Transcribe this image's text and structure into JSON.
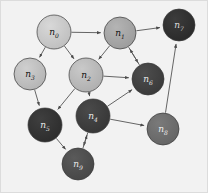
{
  "figure": {
    "background_color": "#f2f2f2",
    "border_color": "#d8d8d8",
    "width": 208,
    "height": 193
  },
  "graph": {
    "type": "directed-graph",
    "node_count": 10,
    "edge_count": 16,
    "edge_color": "#555555",
    "node_stroke_color": "#3a3a3a",
    "label_light_color": "#111111",
    "label_dark_color": "#e8e8e8",
    "nodes": [
      {
        "id": "n0",
        "label": "n",
        "sub": "0",
        "x": 54,
        "y": 32,
        "r": 17,
        "fill": "#d8d8d8",
        "fill_edge": "#bdbdbd",
        "label_color": "#111111"
      },
      {
        "id": "n1",
        "label": "n",
        "sub": "1",
        "x": 120,
        "y": 33,
        "r": 16,
        "fill": "#b4b4b4",
        "fill_edge": "#9a9a9a",
        "label_color": "#111111"
      },
      {
        "id": "n2",
        "label": "n",
        "sub": "2",
        "x": 86,
        "y": 75,
        "r": 17,
        "fill": "#c9c9c9",
        "fill_edge": "#adadad",
        "label_color": "#111111"
      },
      {
        "id": "n3",
        "label": "n",
        "sub": "3",
        "x": 30,
        "y": 74,
        "r": 16,
        "fill": "#cfcfcf",
        "fill_edge": "#b2b2b2",
        "label_color": "#111111"
      },
      {
        "id": "n4",
        "label": "n",
        "sub": "4",
        "x": 93,
        "y": 116,
        "r": 17,
        "fill": "#4a4a4a",
        "fill_edge": "#353535",
        "label_color": "#e8e8e8"
      },
      {
        "id": "n5",
        "label": "n",
        "sub": "5",
        "x": 45,
        "y": 125,
        "r": 17,
        "fill": "#3f3f3f",
        "fill_edge": "#2b2b2b",
        "label_color": "#e8e8e8"
      },
      {
        "id": "n6",
        "label": "n",
        "sub": "6",
        "x": 148,
        "y": 79,
        "r": 16,
        "fill": "#4d4d4d",
        "fill_edge": "#383838",
        "label_color": "#e8e8e8"
      },
      {
        "id": "n7",
        "label": "n",
        "sub": "7",
        "x": 179,
        "y": 25,
        "r": 16,
        "fill": "#3c3c3c",
        "fill_edge": "#282828",
        "label_color": "#dddddd"
      },
      {
        "id": "n8",
        "label": "n",
        "sub": "8",
        "x": 163,
        "y": 129,
        "r": 16,
        "fill": "#7a7a7a",
        "fill_edge": "#636363",
        "label_color": "#eeeeee"
      },
      {
        "id": "n9",
        "label": "n",
        "sub": "9",
        "x": 78,
        "y": 164,
        "r": 16,
        "fill": "#5a5a5a",
        "fill_edge": "#454545",
        "label_color": "#e8e8e8"
      }
    ],
    "edges": [
      {
        "from": "n0",
        "to": "n1"
      },
      {
        "from": "n0",
        "to": "n3"
      },
      {
        "from": "n0",
        "to": "n2"
      },
      {
        "from": "n1",
        "to": "n2"
      },
      {
        "from": "n1",
        "to": "n7"
      },
      {
        "from": "n1",
        "to": "n6"
      },
      {
        "from": "n2",
        "to": "n6"
      },
      {
        "from": "n2",
        "to": "n5"
      },
      {
        "from": "n2",
        "to": "n4"
      },
      {
        "from": "n3",
        "to": "n5"
      },
      {
        "from": "n4",
        "to": "n6"
      },
      {
        "from": "n4",
        "to": "n8"
      },
      {
        "from": "n4",
        "to": "n9"
      },
      {
        "from": "n5",
        "to": "n9"
      },
      {
        "from": "n6",
        "to": "n1"
      },
      {
        "from": "n8",
        "to": "n7"
      },
      {
        "from": "n9",
        "to": "n4"
      }
    ]
  }
}
